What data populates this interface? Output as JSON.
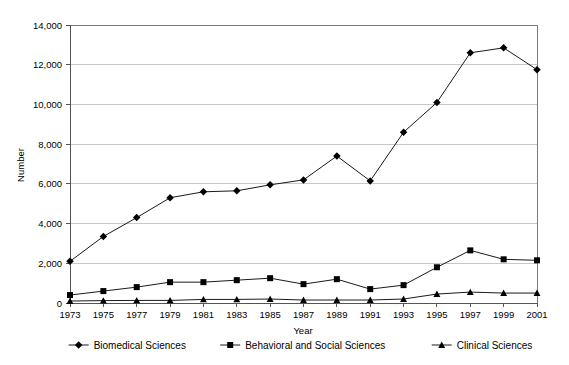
{
  "chart_data": {
    "type": "line",
    "title": "",
    "xlabel": "Year",
    "ylabel": "Number",
    "categories": [
      1973,
      1975,
      1977,
      1979,
      1981,
      1983,
      1985,
      1987,
      1989,
      1991,
      1993,
      1995,
      1997,
      1999,
      2001
    ],
    "xtick_labels": [
      "1973",
      "1975",
      "1977",
      "1979",
      "1981",
      "1983",
      "1985",
      "1987",
      "1989",
      "1991",
      "1993",
      "1995",
      "1997",
      "1999",
      "2001"
    ],
    "ytick_labels": [
      "0",
      "2,000",
      "4,000",
      "6,000",
      "8,000",
      "10,000",
      "12,000",
      "14,000"
    ],
    "ytick_values": [
      0,
      2000,
      4000,
      6000,
      8000,
      10000,
      12000,
      14000
    ],
    "ylim": [
      0,
      14000
    ],
    "xlim": [
      1973,
      2001
    ],
    "grid": "horizontal",
    "legend_position": "bottom",
    "series": [
      {
        "name": "Biomedical Sciences",
        "marker": "diamond",
        "color": "#000000",
        "values": [
          2100,
          3350,
          4300,
          5300,
          5600,
          5650,
          5950,
          6200,
          7400,
          6150,
          8600,
          10100,
          12600,
          12850,
          11750
        ]
      },
      {
        "name": "Behavioral and Social Sciences",
        "marker": "square",
        "color": "#000000",
        "values": [
          400,
          600,
          800,
          1050,
          1050,
          1150,
          1250,
          950,
          1200,
          700,
          900,
          1800,
          2650,
          2200,
          2150
        ]
      },
      {
        "name": "Clinical Sciences",
        "marker": "triangle",
        "color": "#000000",
        "values": [
          100,
          120,
          130,
          130,
          180,
          180,
          200,
          150,
          150,
          150,
          200,
          450,
          550,
          500,
          500
        ]
      }
    ]
  },
  "legend": {
    "items": [
      {
        "label": "Biomedical Sciences"
      },
      {
        "label": "Behavioral and Social Sciences"
      },
      {
        "label": "Clinical Sciences"
      }
    ]
  }
}
